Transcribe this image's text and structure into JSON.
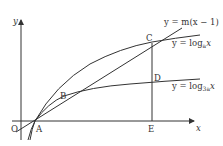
{
  "diagram": {
    "axes": {
      "x_label": "x",
      "y_label": "y",
      "origin_label": "O"
    },
    "points": {
      "A": "A",
      "B": "B",
      "C": "C",
      "D": "D",
      "E": "E"
    },
    "curves": {
      "line": {
        "prefix": "y = m",
        "suffix": "(x − 1)"
      },
      "log_a": {
        "prefix": "y = log",
        "base": "a",
        "arg": "x"
      },
      "log_3a": {
        "prefix": "y = log",
        "base": "3a",
        "arg": "x"
      }
    },
    "colors": {
      "stroke": "#333333",
      "background": "#ffffff"
    }
  }
}
